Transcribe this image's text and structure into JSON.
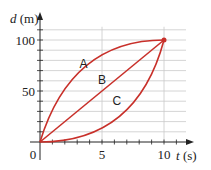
{
  "chart_data": {
    "type": "line",
    "title": "",
    "xlabel": "t (s)",
    "ylabel": "d (m)",
    "xlabel_var": "t",
    "xlabel_unit": "(s)",
    "ylabel_var": "d",
    "ylabel_unit": "(m)",
    "xlim": [
      0,
      11.5
    ],
    "ylim": [
      0,
      115
    ],
    "x_ticks": [
      0,
      5,
      10
    ],
    "x_tick_labels": [
      "0",
      "5",
      "10"
    ],
    "y_ticks": [
      50,
      100
    ],
    "y_tick_labels": [
      "50",
      "100"
    ],
    "grid": {
      "horizontal_every": 10,
      "vertical_at": [
        5,
        10
      ]
    },
    "legend": null,
    "series": [
      {
        "name": "A",
        "x": [
          0,
          2.5,
          5,
          7.5,
          10
        ],
        "values": [
          0,
          45,
          75,
          93,
          100
        ]
      },
      {
        "name": "B",
        "x": [
          0,
          2.5,
          5,
          7.5,
          10
        ],
        "values": [
          0,
          25,
          50,
          75,
          100
        ]
      },
      {
        "name": "C",
        "x": [
          0,
          2.5,
          5,
          7.5,
          10
        ],
        "values": [
          0,
          7,
          25,
          55,
          100
        ]
      }
    ],
    "annotations": [
      {
        "text": "A",
        "x": 3.5,
        "y": 76
      },
      {
        "text": "B",
        "x": 5,
        "y": 61
      },
      {
        "text": "C",
        "x": 6.2,
        "y": 40
      }
    ],
    "endpoint": {
      "x": 10,
      "y": 100
    },
    "colors": {
      "curve": "#c8302a",
      "grid": "#c9c9c9",
      "axis": "#222222"
    }
  }
}
